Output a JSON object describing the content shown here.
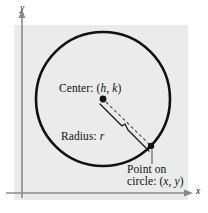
{
  "figure": {
    "background_color": "#ffffff",
    "panel_color": "#ebebeb",
    "ink_color": "#111111",
    "axis_color": "#8a8a8a"
  },
  "axes": {
    "x_label": "x",
    "y_label": "y",
    "origin": {
      "x": 22,
      "y": 193
    }
  },
  "labels": {
    "center": {
      "prefix": "Center: (",
      "var1": "h",
      "sep": ", ",
      "var2": "k",
      "suffix": ")"
    },
    "radius": {
      "prefix": "Radius: ",
      "var1": "r"
    },
    "point_line1": "Point on",
    "point_line2": {
      "prefix": "circle: (",
      "var1": "x",
      "sep": ", ",
      "var2": "y",
      "suffix": ")"
    }
  },
  "geometry": {
    "circle": {
      "cx": 103,
      "cy": 99,
      "r": 67,
      "stroke_width": 2.6
    },
    "center_point": {
      "cx": 103,
      "cy": 99,
      "r": 3.4
    },
    "circle_point": {
      "cx": 151,
      "cy": 146,
      "r": 3.2
    },
    "radius_segment": {
      "x1": 103,
      "y1": 99,
      "x2": 151,
      "y2": 146,
      "style": "dashed"
    },
    "leader_line": {
      "x1": 152,
      "y1": 150,
      "x2": 152,
      "y2": 164
    }
  }
}
